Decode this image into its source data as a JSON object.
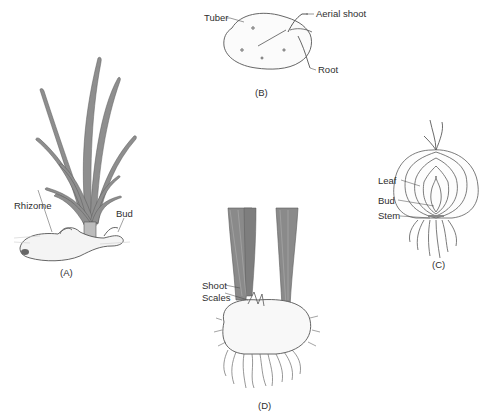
{
  "diagram": {
    "panels": [
      {
        "id": "A",
        "caption": "(A)",
        "subject": "rhizome plant with grass-like leaves",
        "labels": [
          "Rhizome",
          "Bud"
        ]
      },
      {
        "id": "B",
        "caption": "(B)",
        "subject": "potato tuber",
        "labels": [
          "Tuber",
          "Aerial shoot",
          "Root"
        ]
      },
      {
        "id": "C",
        "caption": "(C)",
        "subject": "onion bulb cross-section",
        "labels": [
          "Leaf",
          "Bud",
          "Stem"
        ]
      },
      {
        "id": "D",
        "caption": "(D)",
        "subject": "corm with shoots",
        "labels": [
          "Shoot",
          "Scales"
        ]
      }
    ],
    "colors": {
      "background": "#ffffff",
      "ink": "#4a4a4a",
      "leaf_fill": "#8a8a8a",
      "text": "#2e2e2e"
    }
  }
}
